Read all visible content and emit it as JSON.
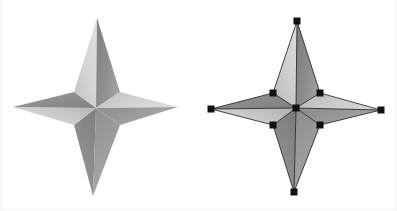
{
  "figure": {
    "background_color": "#ffffff",
    "width": 397,
    "height": 211,
    "panels": [
      {
        "id": "left",
        "name": "shaded-star",
        "caption": "",
        "show_vertex_markers": false,
        "show_edges": false,
        "center": {
          "x": 96,
          "y": 108
        },
        "tips": {
          "top": {
            "x": 97,
            "y": 18
          },
          "right": {
            "x": 178,
            "y": 107
          },
          "bottom": {
            "x": 93,
            "y": 196
          },
          "left": {
            "x": 13,
            "y": 107
          }
        },
        "inner_vertices": {
          "top_left": {
            "x": 74,
            "y": 92
          },
          "top_right": {
            "x": 120,
            "y": 92
          },
          "bottom_right": {
            "x": 120,
            "y": 125
          },
          "bottom_left": {
            "x": 74,
            "y": 125
          }
        },
        "faces": [
          {
            "name": "top-left-face",
            "shade": "#d2d2d2"
          },
          {
            "name": "top-right-face",
            "shade": "#8d8d8d"
          },
          {
            "name": "right-upper-face",
            "shade": "#cfcfcf"
          },
          {
            "name": "right-lower-face",
            "shade": "#9a9a9a"
          },
          {
            "name": "bottom-right-face",
            "shade": "#9c9c9c"
          },
          {
            "name": "bottom-left-face",
            "shade": "#8a8a8a"
          },
          {
            "name": "left-lower-face",
            "shade": "#c8c8c8"
          },
          {
            "name": "left-upper-face",
            "shade": "#8b8b8b"
          }
        ]
      },
      {
        "id": "right",
        "name": "wireframe-star-with-vertices",
        "caption": "",
        "show_vertex_markers": true,
        "show_edges": true,
        "center": {
          "x": 98,
          "y": 108
        },
        "tips": {
          "top": {
            "x": 99,
            "y": 21
          },
          "right": {
            "x": 183,
            "y": 110
          },
          "bottom": {
            "x": 96,
            "y": 192
          },
          "left": {
            "x": 13,
            "y": 109
          }
        },
        "inner_vertices": {
          "top_left": {
            "x": 75,
            "y": 93
          },
          "top_right": {
            "x": 122,
            "y": 93
          },
          "bottom_right": {
            "x": 122,
            "y": 125
          },
          "bottom_left": {
            "x": 75,
            "y": 125
          }
        },
        "faces": [
          {
            "name": "top-left-face",
            "shade": "#cccccc"
          },
          {
            "name": "top-right-face",
            "shade": "#8a8a8a"
          },
          {
            "name": "right-upper-face",
            "shade": "#c9c9c9"
          },
          {
            "name": "right-lower-face",
            "shade": "#979797"
          },
          {
            "name": "bottom-right-face",
            "shade": "#9a9a9a"
          },
          {
            "name": "bottom-left-face",
            "shade": "#878787"
          },
          {
            "name": "left-lower-face",
            "shade": "#c4c4c4"
          },
          {
            "name": "left-upper-face",
            "shade": "#888888"
          }
        ],
        "edge_color": "#1a1a1a",
        "edge_width": 0.8,
        "vertex_marker": {
          "shape": "square",
          "color": "#111111",
          "size": 6,
          "count": 9
        }
      }
    ],
    "colors": {
      "light_face": "#d2d2d2",
      "mid_face": "#9a9a9a",
      "dark_face": "#8a8a8a",
      "edge": "#1a1a1a",
      "vertex_marker": "#111111",
      "paper": "#ffffff"
    }
  }
}
